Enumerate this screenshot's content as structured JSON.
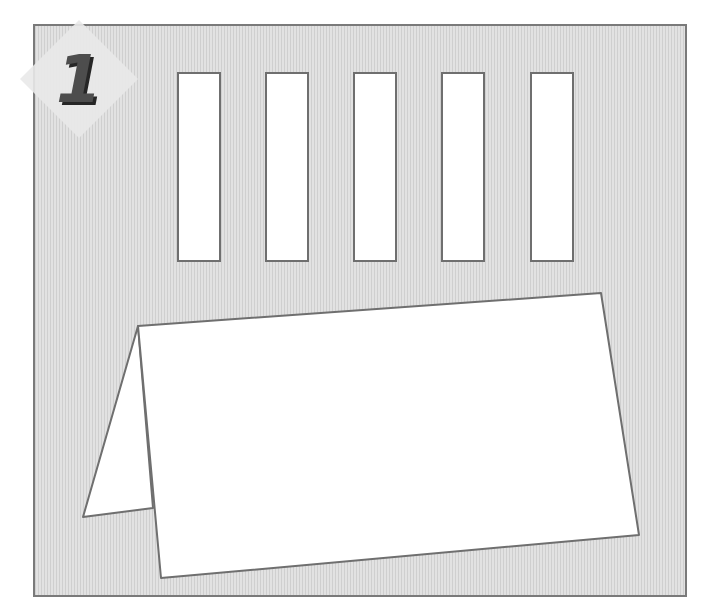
{
  "step": {
    "number": "1",
    "badge_shape": "diamond",
    "badge_color": "#e6e6e6",
    "number_color": "#4d4d4d"
  },
  "frame": {
    "background": "#d6d6d6",
    "border_color": "#7a7a7a"
  },
  "slots": [
    {
      "id": "slot-1",
      "x": 177,
      "y": 72,
      "w": 44,
      "h": 190
    },
    {
      "id": "slot-2",
      "x": 265,
      "y": 72,
      "w": 44,
      "h": 190
    },
    {
      "id": "slot-3",
      "x": 353,
      "y": 72,
      "w": 44,
      "h": 190
    },
    {
      "id": "slot-4",
      "x": 441,
      "y": 72,
      "w": 44,
      "h": 190
    },
    {
      "id": "slot-5",
      "x": 530,
      "y": 72,
      "w": 44,
      "h": 190
    }
  ],
  "tent_card": {
    "back_flap": [
      [
        138,
        326
      ],
      [
        83,
        517
      ],
      [
        153,
        508
      ]
    ],
    "front_panel": [
      [
        138,
        326
      ],
      [
        601,
        293
      ],
      [
        639,
        535
      ],
      [
        161,
        578
      ]
    ],
    "stroke": "#6f6f6f",
    "fill": "#ffffff"
  }
}
